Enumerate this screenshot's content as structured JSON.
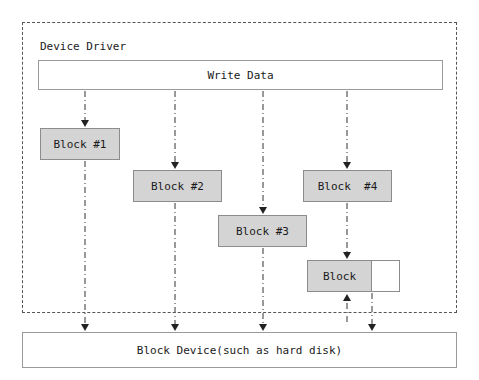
{
  "diagram": {
    "canvas": {
      "width": 479,
      "height": 380,
      "background": "#ffffff"
    },
    "colors": {
      "block_fill": "#d4d4d4",
      "block_stroke": "#8c8c8c",
      "plain_fill": "#ffffff",
      "plain_stroke": "#9a9a9a",
      "frame_stroke": "#555555",
      "line": "#333333",
      "text": "#1a1a1a"
    },
    "frame": {
      "label": "Device Driver",
      "style": "dashed"
    },
    "nodes": [
      {
        "id": "write_data",
        "label": "Write Data",
        "style": "plain",
        "x": 38,
        "y": 60,
        "w": 405,
        "h": 30
      },
      {
        "id": "block1",
        "label": "Block #1",
        "style": "gray",
        "x": 40,
        "y": 128,
        "w": 80,
        "h": 32
      },
      {
        "id": "block2",
        "label": "Block #2",
        "style": "gray",
        "x": 133,
        "y": 170,
        "w": 89,
        "h": 32
      },
      {
        "id": "block4",
        "label": "Block  #4",
        "style": "gray",
        "x": 303,
        "y": 170,
        "w": 89,
        "h": 32
      },
      {
        "id": "block3",
        "label": "Block #3",
        "style": "gray",
        "x": 218,
        "y": 215,
        "w": 89,
        "h": 32
      },
      {
        "id": "block_partial",
        "label": "Block",
        "style": "gray",
        "x": 307,
        "y": 260,
        "w": 65,
        "h": 32
      },
      {
        "id": "block_tail",
        "label": "",
        "style": "white",
        "x": 372,
        "y": 260,
        "w": 28,
        "h": 32
      },
      {
        "id": "block_device",
        "label": "Block Device(such as hard disk)",
        "style": "plain",
        "x": 22,
        "y": 332,
        "w": 435,
        "h": 36
      }
    ],
    "lanes": [
      {
        "id": "lane1",
        "x": 85
      },
      {
        "id": "lane2",
        "x": 175
      },
      {
        "id": "lane3",
        "x": 263
      },
      {
        "id": "lane4",
        "x": 347
      },
      {
        "id": "lane5",
        "x": 372
      }
    ],
    "edges": [
      {
        "id": "e-write-block1",
        "from": "write_data",
        "to": "block1",
        "x": 85,
        "y1": 91,
        "y2": 127,
        "arrow": "down"
      },
      {
        "id": "e-write-block2",
        "from": "write_data",
        "to": "block2",
        "x": 175,
        "y1": 91,
        "y2": 169,
        "arrow": "down"
      },
      {
        "id": "e-write-block3",
        "from": "write_data",
        "to": "block3",
        "x": 263,
        "y1": 91,
        "y2": 214,
        "arrow": "down"
      },
      {
        "id": "e-write-block4",
        "from": "write_data",
        "to": "block4",
        "x": 347,
        "y1": 91,
        "y2": 169,
        "arrow": "down"
      },
      {
        "id": "e-block1-dev",
        "from": "block1",
        "to": "block_device",
        "x": 85,
        "y1": 161,
        "y2": 331,
        "arrow": "down"
      },
      {
        "id": "e-block2-dev",
        "from": "block2",
        "to": "block_device",
        "x": 175,
        "y1": 203,
        "y2": 331,
        "arrow": "down"
      },
      {
        "id": "e-block3-dev",
        "from": "block3",
        "to": "block_device",
        "x": 263,
        "y1": 248,
        "y2": 331,
        "arrow": "down"
      },
      {
        "id": "e-block4-blockp",
        "from": "block4",
        "to": "block_partial",
        "x": 347,
        "y1": 203,
        "y2": 259,
        "arrow": "down"
      },
      {
        "id": "e-dev-blockp",
        "from": "block_device",
        "to": "block_partial",
        "x": 347,
        "y1": 322,
        "y2": 294,
        "arrow": "up"
      },
      {
        "id": "e-blockp-dev",
        "from": "block_partial",
        "to": "block_device",
        "x": 372,
        "y1": 293,
        "y2": 331,
        "arrow": "down"
      }
    ]
  }
}
